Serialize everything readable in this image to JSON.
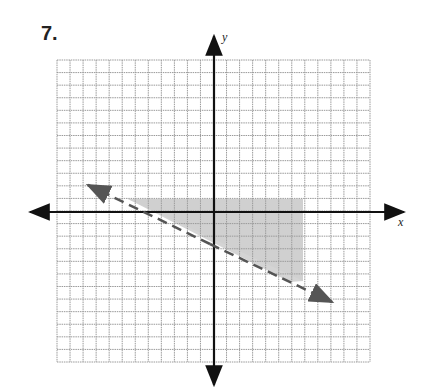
{
  "problem": {
    "number": "7."
  },
  "graph": {
    "x_axis_label": "x",
    "y_axis_label": "y",
    "grid": {
      "left": 57,
      "top": 60,
      "right": 370,
      "bottom": 362,
      "cols": 24,
      "rows": 24
    },
    "origin_px": [
      214,
      212
    ],
    "boundary_line": {
      "style": "dashed",
      "equation": "y = -1/2 x - 3",
      "from_px": [
        88,
        185
      ],
      "to_px": [
        332,
        302
      ]
    },
    "shaded_region": {
      "description": "above dashed line, y < 1, x < 7",
      "color": "#c8c8c8"
    },
    "colors": {
      "grid": "#9a9a9a",
      "axis": "#111111",
      "line": "#555555",
      "shade": "#cfcfcf"
    }
  }
}
